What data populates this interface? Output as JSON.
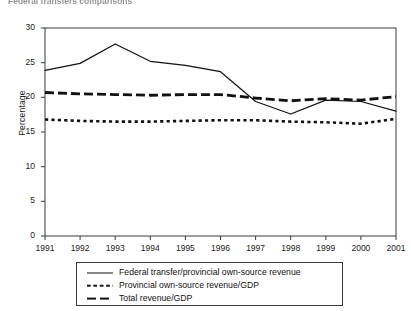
{
  "caption": {
    "text": "Federal transfers comparisons"
  },
  "chart_data": {
    "type": "line",
    "title": "",
    "xlabel": "",
    "ylabel": "Percentage",
    "categories": [
      "1991",
      "1992",
      "1993",
      "1994",
      "1995",
      "1996",
      "1997",
      "1998",
      "1999",
      "2000",
      "2001"
    ],
    "x": [
      1991,
      1992,
      1993,
      1994,
      1995,
      1996,
      1997,
      1998,
      1999,
      2000,
      2001
    ],
    "ylim": [
      0,
      30
    ],
    "yticks": [
      0,
      5,
      10,
      15,
      20,
      25,
      30
    ],
    "xlim": [
      1991,
      2001
    ],
    "grid": false,
    "legend_position": "below-plot",
    "series": [
      {
        "name": "Federal transfer/provincial own-source revenue",
        "style": "solid",
        "color": "#111111",
        "values": [
          23.9,
          24.9,
          27.7,
          25.2,
          24.6,
          23.7,
          19.4,
          17.6,
          19.6,
          19.4,
          18.0
        ]
      },
      {
        "name": "Provincial own-source revenue/GDP",
        "style": "dotted",
        "color": "#111111",
        "values": [
          16.8,
          16.6,
          16.5,
          16.5,
          16.6,
          16.7,
          16.7,
          16.5,
          16.4,
          16.2,
          16.9
        ]
      },
      {
        "name": "Total revenue/GDP",
        "style": "dashed",
        "color": "#111111",
        "values": [
          20.7,
          20.5,
          20.4,
          20.3,
          20.4,
          20.4,
          19.9,
          19.5,
          19.8,
          19.6,
          20.1
        ]
      }
    ]
  },
  "axes": {
    "y_tick_labels": [
      "30",
      "25",
      "20",
      "15",
      "10",
      "5",
      "0"
    ],
    "x_tick_labels": [
      "1991",
      "1992",
      "1993",
      "1994",
      "1995",
      "1996",
      "1997",
      "1998",
      "1999",
      "2000",
      "2001"
    ],
    "y_axis_title": "Percentage"
  },
  "legend": {
    "items": [
      {
        "label": "Federal transfer/provincial own-source revenue",
        "style": "solid"
      },
      {
        "label": "Provincial own-source revenue/GDP",
        "style": "dotted"
      },
      {
        "label": "Total revenue/GDP",
        "style": "dashed"
      }
    ]
  }
}
